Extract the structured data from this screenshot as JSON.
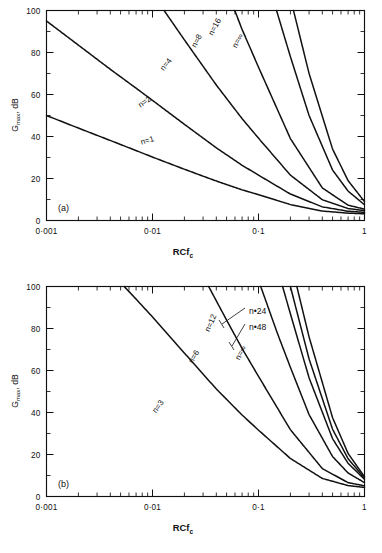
{
  "figure": {
    "panels": [
      {
        "tag": "(a)",
        "tag_name": "panel-label-a",
        "xlabel": "RCf",
        "xlabel_sub": "c",
        "ylabel": "G",
        "ylabel_sub": "max",
        "ylabel_tail": ", dB",
        "xticklabels": [
          "0·001",
          "0·01",
          "0·1",
          "1"
        ],
        "yticklabels": [
          "0",
          "20",
          "40",
          "60",
          "80",
          "100"
        ],
        "curve_labels": [
          "n=1",
          "n=2",
          "n=4",
          "n=8",
          "n=16",
          "n=∞"
        ]
      },
      {
        "tag": "(b)",
        "tag_name": "panel-label-b",
        "xlabel": "RCf",
        "xlabel_sub": "c",
        "ylabel": "G",
        "ylabel_sub": "max",
        "ylabel_tail": ", dB",
        "xticklabels": [
          "0·001",
          "0·01",
          "0·1",
          "1"
        ],
        "yticklabels": [
          "0",
          "20",
          "40",
          "60",
          "80",
          "100"
        ],
        "curve_labels": [
          "n=3",
          "n=6",
          "n=12",
          "n=∞"
        ],
        "callout_labels": [
          "n•48",
          "n•24"
        ]
      }
    ]
  },
  "chart_data": [
    {
      "type": "line",
      "title": "(a)",
      "xlabel": "RCfc",
      "ylabel": "Gmax, dB",
      "xscale": "log",
      "yscale": "linear",
      "xlim": [
        0.001,
        1
      ],
      "ylim": [
        0,
        100
      ],
      "xticks": [
        0.001,
        0.01,
        0.1,
        1
      ],
      "xticklabels": [
        "0·001",
        "0·01",
        "0·1",
        "1"
      ],
      "yticks": [
        0,
        20,
        40,
        60,
        80,
        100
      ],
      "yticklabels": [
        "0",
        "20",
        "40",
        "60",
        "80",
        "100"
      ],
      "grid": false,
      "legend": "inline-rotated",
      "series": [
        {
          "name": "n=1",
          "x": [
            0.001,
            0.002,
            0.004,
            0.007,
            0.01,
            0.02,
            0.04,
            0.07,
            0.1,
            0.2,
            0.4,
            0.7,
            1.0
          ],
          "y": [
            50.0,
            44.0,
            38.1,
            33.3,
            30.2,
            24.4,
            18.8,
            14.6,
            12.3,
            7.6,
            4.5,
            3.5,
            3.2
          ]
        },
        {
          "name": "n=2",
          "x": [
            0.001,
            0.002,
            0.004,
            0.007,
            0.01,
            0.02,
            0.04,
            0.07,
            0.1,
            0.2,
            0.4,
            0.7,
            1.0
          ],
          "y": [
            95.0,
            83.5,
            72.0,
            63.0,
            57.2,
            45.8,
            34.6,
            26.3,
            21.6,
            12.6,
            6.5,
            4.4,
            3.9
          ]
        },
        {
          "name": "n=4",
          "x": [
            0.002,
            0.004,
            0.007,
            0.01,
            0.02,
            0.04,
            0.07,
            0.1,
            0.2,
            0.4,
            0.7,
            1.0
          ],
          "y": [
            158.0,
            136.0,
            119.0,
            108.0,
            86.0,
            64.5,
            48.5,
            39.2,
            21.6,
            9.9,
            5.7,
            4.7
          ]
        },
        {
          "name": "n=8",
          "x": [
            0.007,
            0.01,
            0.02,
            0.03,
            0.05,
            0.07,
            0.1,
            0.2,
            0.4,
            0.7,
            1.0
          ],
          "y": [
            224.0,
            203.0,
            161.0,
            137.0,
            110.0,
            91.0,
            73.0,
            39.0,
            15.5,
            7.3,
            5.4
          ]
        },
        {
          "name": "n=16",
          "x": [
            0.02,
            0.03,
            0.04,
            0.06,
            0.08,
            0.1,
            0.15,
            0.2,
            0.3,
            0.5,
            0.7,
            1.0
          ],
          "y": [
            292.0,
            248.0,
            218.0,
            177.0,
            150.0,
            131.0,
            99.0,
            78.0,
            50.0,
            24.0,
            14.0,
            7.5
          ]
        },
        {
          "name": "n=∞",
          "x": [
            0.03,
            0.04,
            0.06,
            0.08,
            0.1,
            0.15,
            0.2,
            0.3,
            0.5,
            0.7,
            1.0
          ],
          "y": [
            330.0,
            292.0,
            238.0,
            202.0,
            176.0,
            133.0,
            106.0,
            70.0,
            34.0,
            19.0,
            9.0
          ]
        }
      ]
    },
    {
      "type": "line",
      "title": "(b)",
      "xlabel": "RCfc",
      "ylabel": "Gmax, dB",
      "xscale": "log",
      "yscale": "linear",
      "xlim": [
        0.001,
        1
      ],
      "ylim": [
        0,
        100
      ],
      "xticks": [
        0.001,
        0.01,
        0.1,
        1
      ],
      "xticklabels": [
        "0·001",
        "0·01",
        "0·1",
        "1"
      ],
      "yticks": [
        0,
        20,
        40,
        60,
        80,
        100
      ],
      "yticklabels": [
        "0",
        "20",
        "40",
        "60",
        "80",
        "100"
      ],
      "grid": false,
      "legend": "inline-rotated-with-callouts",
      "series": [
        {
          "name": "n=3",
          "x": [
            0.002,
            0.004,
            0.007,
            0.01,
            0.02,
            0.04,
            0.07,
            0.1,
            0.2,
            0.4,
            0.7,
            1.0
          ],
          "y": [
            124.0,
            107.0,
            94.0,
            85.5,
            68.3,
            51.2,
            38.8,
            31.6,
            18.1,
            8.6,
            5.2,
            4.3
          ]
        },
        {
          "name": "n=6",
          "x": [
            0.006,
            0.01,
            0.02,
            0.03,
            0.05,
            0.07,
            0.1,
            0.2,
            0.4,
            0.7,
            1.0
          ],
          "y": [
            182.0,
            155.0,
            123.0,
            105.0,
            84.0,
            70.5,
            57.2,
            31.8,
            13.3,
            6.6,
            5.1
          ]
        },
        {
          "name": "n=12",
          "x": [
            0.015,
            0.02,
            0.03,
            0.05,
            0.07,
            0.1,
            0.15,
            0.2,
            0.3,
            0.5,
            0.7,
            1.0
          ],
          "y": [
            250.0,
            227.0,
            192.0,
            152.0,
            127.0,
            103.0,
            78.0,
            61.5,
            39.0,
            19.0,
            11.2,
            6.6
          ]
        },
        {
          "name": "n=24",
          "x": [
            0.025,
            0.04,
            0.06,
            0.08,
            0.1,
            0.15,
            0.2,
            0.3,
            0.5,
            0.7,
            1.0
          ],
          "y": [
            283.0,
            235.0,
            193.0,
            165.0,
            144.0,
            109.0,
            87.0,
            56.5,
            27.5,
            15.8,
            8.2
          ]
        },
        {
          "name": "n=48",
          "x": [
            0.03,
            0.04,
            0.06,
            0.08,
            0.1,
            0.15,
            0.2,
            0.3,
            0.5,
            0.7,
            1.0
          ],
          "y": [
            310.0,
            274.0,
            223.0,
            191.0,
            166.0,
            126.0,
            100.0,
            65.5,
            32.0,
            18.0,
            8.8
          ]
        },
        {
          "name": "n=∞",
          "x": [
            0.035,
            0.05,
            0.07,
            0.09,
            0.12,
            0.16,
            0.22,
            0.3,
            0.5,
            0.7,
            1.0
          ],
          "y": [
            322.0,
            274.0,
            228.0,
            196.0,
            163.0,
            134.0,
            104.0,
            76.0,
            37.5,
            20.5,
            9.4
          ]
        }
      ]
    }
  ]
}
